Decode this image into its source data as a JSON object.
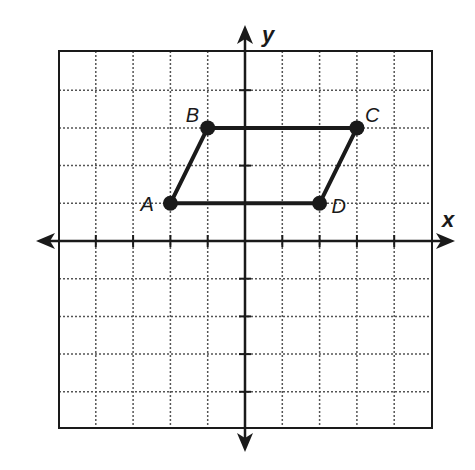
{
  "figure": {
    "type": "coordinate-plane",
    "x_axis_label": "x",
    "y_axis_label": "y",
    "grid": {
      "xmin": -5,
      "xmax": 5,
      "ymin": -5,
      "ymax": 5,
      "step": 1,
      "style": "dotted"
    },
    "colors": {
      "ink": "#1a1a1a",
      "grid": "#555555",
      "background": "#ffffff"
    }
  },
  "shape": {
    "name": "parallelogram ABCD",
    "vertices": [
      {
        "label": "A",
        "x": -2,
        "y": 1
      },
      {
        "label": "B",
        "x": -1,
        "y": 3
      },
      {
        "label": "C",
        "x": 3,
        "y": 3
      },
      {
        "label": "D",
        "x": 2,
        "y": 1
      }
    ]
  },
  "chart_data": {
    "type": "scatter",
    "title": "",
    "xlabel": "x",
    "ylabel": "y",
    "xlim": [
      -5,
      5
    ],
    "ylim": [
      -5,
      5
    ],
    "grid": true,
    "series": [
      {
        "name": "ABCD",
        "closed_polygon": true,
        "points": [
          {
            "label": "A",
            "x": -2,
            "y": 1
          },
          {
            "label": "B",
            "x": -1,
            "y": 3
          },
          {
            "label": "C",
            "x": 3,
            "y": 3
          },
          {
            "label": "D",
            "x": 2,
            "y": 1
          }
        ]
      }
    ]
  }
}
